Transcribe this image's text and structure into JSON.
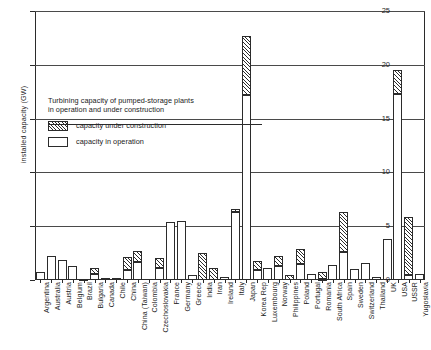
{
  "chart_data": {
    "type": "bar",
    "title": "Turbining capacity of pumped-storage plants in operation and under construction",
    "xlabel": "",
    "ylabel": "installed capacity (GW)",
    "ylim": [
      0,
      25
    ],
    "yticks": [
      0,
      5,
      10,
      15,
      20,
      25
    ],
    "ytick_labels": [
      "0",
      "5",
      "10",
      "15",
      "20",
      "25"
    ],
    "grid": true,
    "stacked": true,
    "legend_position": "upper-left-inside",
    "categories": [
      "Argentina",
      "Australia",
      "Austria",
      "Belgium",
      "Brazil",
      "Bulgaria",
      "Canada",
      "Chile",
      "China",
      "China (Taiwan)",
      "Colombia",
      "Czechoslovakia",
      "France",
      "Germany",
      "Greece",
      "India",
      "Iran",
      "Ireland",
      "Italy",
      "Japan",
      "Korea Rep",
      "Luxembourg",
      "Norway",
      "Philippines",
      "Poland",
      "Portugal",
      "Romania",
      "South Africa",
      "Spain",
      "Sweden",
      "Switzerland",
      "Thailand",
      "UK",
      "USA",
      "USSR",
      "Yugoslavia"
    ],
    "series": [
      {
        "name": "capacity in operation",
        "pattern": "open",
        "values": [
          0.7,
          2.2,
          1.9,
          1.3,
          0.05,
          0.55,
          0.2,
          0.0,
          0.9,
          1.7,
          0.0,
          1.1,
          5.4,
          5.5,
          0.45,
          0.0,
          0.0,
          0.3,
          6.3,
          17.2,
          0.9,
          1.1,
          1.3,
          0.0,
          1.5,
          0.6,
          0.1,
          1.4,
          2.6,
          1.0,
          1.6,
          0.25,
          3.8,
          17.3,
          0.5,
          0.6
        ]
      },
      {
        "name": "capacity under construction",
        "pattern": "hatched",
        "values": [
          0.0,
          0.0,
          0.0,
          0.0,
          0.0,
          0.55,
          0.0,
          0.1,
          1.2,
          1.0,
          0.0,
          0.9,
          0.0,
          0.0,
          0.0,
          2.5,
          1.1,
          0.0,
          0.3,
          5.5,
          0.9,
          0.0,
          0.9,
          0.5,
          1.4,
          0.0,
          0.6,
          0.0,
          3.7,
          0.0,
          0.0,
          0.0,
          0.0,
          2.2,
          5.4,
          0.0
        ]
      }
    ]
  },
  "legend": {
    "title_line1": "Turbining capacity of pumped-storage plants",
    "title_line2": "in operation and under construction",
    "items": [
      {
        "label": "capacity under construction",
        "pattern": "hatched"
      },
      {
        "label": "capacity in operation",
        "pattern": "open"
      }
    ]
  }
}
